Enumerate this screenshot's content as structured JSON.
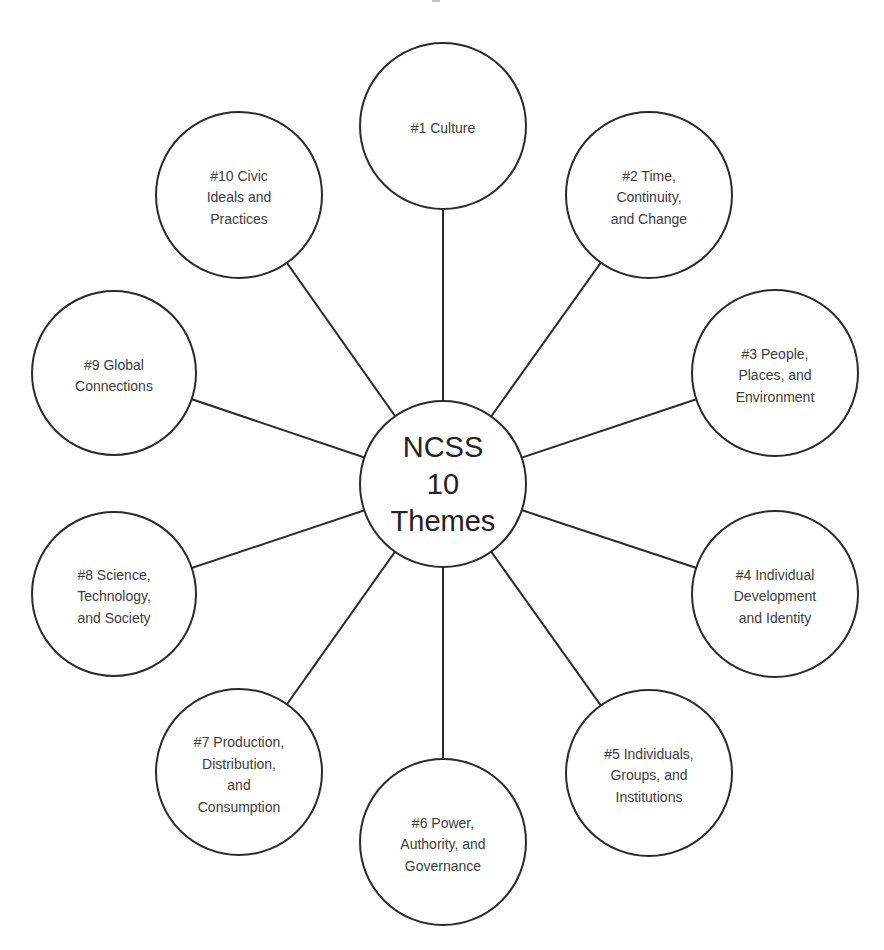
{
  "diagram": {
    "type": "hub-and-spoke",
    "hub": {
      "label": "NCSS\n10\nThemes",
      "cx": 443,
      "cy": 484,
      "r": 84
    },
    "nodes": [
      {
        "id": "theme-1",
        "label": "#1 Culture",
        "cx": 443,
        "cy": 126,
        "r": 84
      },
      {
        "id": "theme-2",
        "label": "#2 Time,\nContinuity,\nand Change",
        "cx": 649,
        "cy": 195,
        "r": 84
      },
      {
        "id": "theme-3",
        "label": "#3 People,\nPlaces, and\nEnvironment",
        "cx": 775,
        "cy": 373,
        "r": 84
      },
      {
        "id": "theme-4",
        "label": "#4 Individual\nDevelopment\nand Identity",
        "cx": 775,
        "cy": 594,
        "r": 84
      },
      {
        "id": "theme-5",
        "label": "#5 Individuals,\nGroups, and\nInstitutions",
        "cx": 649,
        "cy": 773,
        "r": 84
      },
      {
        "id": "theme-6",
        "label": "#6 Power,\nAuthority, and\nGovernance",
        "cx": 443,
        "cy": 842,
        "r": 84
      },
      {
        "id": "theme-7",
        "label": "#7 Production,\nDistribution,\nand\nConsumption",
        "cx": 239,
        "cy": 772,
        "r": 84
      },
      {
        "id": "theme-8",
        "label": "#8 Science,\nTechnology,\nand Society",
        "cx": 114,
        "cy": 594,
        "r": 83
      },
      {
        "id": "theme-9",
        "label": "#9 Global\nConnections",
        "cx": 114,
        "cy": 373,
        "r": 83
      },
      {
        "id": "theme-10",
        "label": "#10 Civic\nIdeals and\nPractices",
        "cx": 239,
        "cy": 195,
        "r": 84
      }
    ],
    "colors": {
      "stroke": "#2b2b2b",
      "text": "#3c3c3c",
      "background": "#ffffff"
    }
  }
}
